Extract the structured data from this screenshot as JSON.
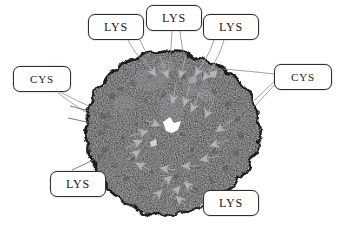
{
  "figure": {
    "kind": "molecular-structure-annotated-figure",
    "background_color": "#ffffff",
    "molecule": {
      "name": "space-filling-protein-surface",
      "fill_color": "#161617",
      "speckle_color": "#4a4a4d",
      "highlight_color": "#8e8e92",
      "cavity_color": "#ffffff"
    },
    "marker": {
      "name": "residue-arrowhead",
      "color": "#b0b0b4",
      "outline_color": "#8c8c90",
      "count": 22
    },
    "leader_line": {
      "color": "#8a8a8e",
      "width": 0.8
    }
  },
  "callouts": [
    {
      "id": "lys-top-left",
      "label": "LYS",
      "residue": "LYS",
      "x": 88,
      "y": 14,
      "w": 56,
      "h": 26,
      "font_size": 12
    },
    {
      "id": "lys-top-center",
      "label": "LYS",
      "residue": "LYS",
      "x": 146,
      "y": 5,
      "w": 56,
      "h": 26,
      "font_size": 12
    },
    {
      "id": "lys-top-right",
      "label": "LYS",
      "residue": "LYS",
      "x": 203,
      "y": 14,
      "w": 56,
      "h": 26,
      "font_size": 12
    },
    {
      "id": "cys-left",
      "label": "CYS",
      "residue": "CYS",
      "x": 13,
      "y": 66,
      "w": 58,
      "h": 26,
      "font_size": 11
    },
    {
      "id": "cys-right",
      "label": "CYS",
      "residue": "CYS",
      "x": 274,
      "y": 64,
      "w": 58,
      "h": 26,
      "font_size": 11
    },
    {
      "id": "lys-bottom-left",
      "label": "LYS",
      "residue": "LYS",
      "x": 50,
      "y": 171,
      "w": 56,
      "h": 26,
      "font_size": 12
    },
    {
      "id": "lys-bottom-right",
      "label": "LYS",
      "residue": "LYS",
      "x": 203,
      "y": 190,
      "w": 56,
      "h": 26,
      "font_size": 12
    }
  ]
}
